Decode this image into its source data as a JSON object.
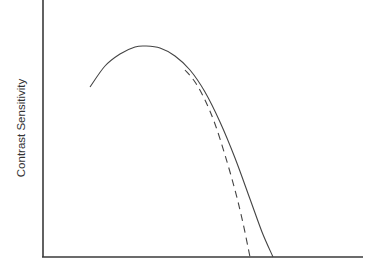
{
  "chart_data": {
    "type": "line",
    "title": "",
    "xlabel": "",
    "ylabel": "Contrast Sensitivity",
    "grid": false,
    "legend": null,
    "x_ticks": [],
    "y_ticks": [],
    "axes_px": {
      "origin": [
        43,
        257
      ],
      "x_end": 363,
      "y_top": 0
    },
    "series": [
      {
        "name": "solid curve",
        "style": "solid",
        "color": "#444444",
        "points_px": [
          [
            90,
            87
          ],
          [
            105,
            66
          ],
          [
            120,
            54
          ],
          [
            135,
            47
          ],
          [
            145,
            46
          ],
          [
            160,
            48
          ],
          [
            175,
            56
          ],
          [
            190,
            70
          ],
          [
            205,
            92
          ],
          [
            220,
            122
          ],
          [
            235,
            158
          ],
          [
            250,
            199
          ],
          [
            262,
            232
          ],
          [
            273,
            257
          ]
        ]
      },
      {
        "name": "dashed curve",
        "style": "dashed",
        "color": "#444444",
        "points_px": [
          [
            185,
            70
          ],
          [
            195,
            82
          ],
          [
            205,
            100
          ],
          [
            215,
            124
          ],
          [
            225,
            155
          ],
          [
            235,
            190
          ],
          [
            243,
            223
          ],
          [
            250,
            257
          ]
        ]
      }
    ]
  }
}
